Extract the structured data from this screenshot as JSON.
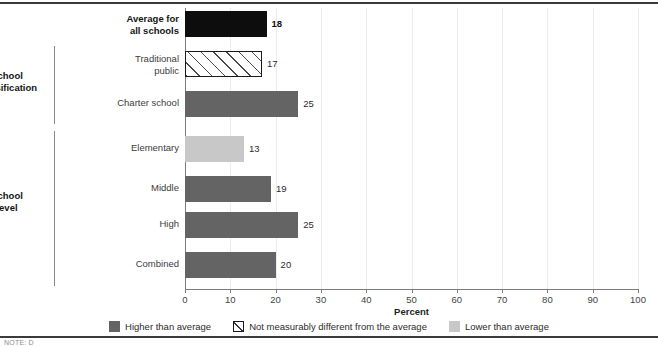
{
  "chart_data": {
    "type": "bar",
    "orientation": "horizontal",
    "title": "",
    "xlabel": "Percent",
    "ylabel": "",
    "xlim": [
      0,
      100
    ],
    "xticks": [
      0,
      10,
      20,
      30,
      40,
      50,
      60,
      70,
      80,
      90,
      100
    ],
    "grid": "vertical",
    "legend_position": "bottom-center",
    "categories": [
      "Average for all schools",
      "Traditional public",
      "Charter school",
      "Elementary",
      "Middle",
      "High",
      "Combined"
    ],
    "values": [
      18,
      17,
      25,
      13,
      19,
      25,
      20
    ],
    "point_styles": [
      "average",
      "not-measurably-different",
      "higher-than-average",
      "lower-than-average",
      "higher-than-average",
      "higher-than-average",
      "higher-than-average"
    ],
    "groups": [
      {
        "label": "School classification",
        "categories": [
          "Traditional public",
          "Charter school"
        ]
      },
      {
        "label": "School level",
        "categories": [
          "Elementary",
          "Middle",
          "High",
          "Combined"
        ]
      }
    ],
    "legend": [
      {
        "label": "Higher than average",
        "style": "higher-than-average"
      },
      {
        "label": "Not measurably different from the average",
        "style": "not-measurably-different"
      },
      {
        "label": "Lower than average",
        "style": "lower-than-average"
      }
    ],
    "colors": {
      "average": "#0d0d0d",
      "higher_than_average": "#646464",
      "lower_than_average": "#c8c8c8",
      "not_measurably_different": "#ffffff",
      "gridline": "#ececec",
      "axis": "#7c7c7c",
      "rule": "#3a3a3a"
    }
  },
  "bars": [
    {
      "label_line1": "Average for",
      "label_line2": "all schools",
      "value": "18",
      "style": "black",
      "bold": true,
      "top": 11,
      "label_top": 13
    },
    {
      "label_line1": "Traditional",
      "label_line2": "public",
      "value": "17",
      "style": "hatch",
      "bold": false,
      "top": 51,
      "label_top": 53
    },
    {
      "label_line1": "Charter school",
      "label_line2": "",
      "value": "25",
      "style": "dark",
      "bold": false,
      "top": 91,
      "label_top": 97
    },
    {
      "label_line1": "Elementary",
      "label_line2": "",
      "value": "13",
      "style": "light",
      "bold": false,
      "top": 136,
      "label_top": 142
    },
    {
      "label_line1": "Middle",
      "label_line2": "",
      "value": "19",
      "style": "dark",
      "bold": false,
      "top": 176,
      "label_top": 182
    },
    {
      "label_line1": "High",
      "label_line2": "",
      "value": "25",
      "style": "dark",
      "bold": false,
      "top": 212,
      "label_top": 218
    },
    {
      "label_line1": "Combined",
      "label_line2": "",
      "value": "20",
      "style": "dark",
      "bold": false,
      "top": 252,
      "label_top": 258
    }
  ],
  "groups": [
    {
      "label_line1": "School",
      "label_line2": "classification",
      "bracket_top": 46,
      "bracket_height": 78,
      "label_top": 70
    },
    {
      "label_line1": "School",
      "label_line2": "level",
      "bracket_top": 131,
      "bracket_height": 155,
      "label_top": 190
    }
  ],
  "axis": {
    "ticks": [
      {
        "label": "0",
        "value": 0
      },
      {
        "label": "10",
        "value": 10
      },
      {
        "label": "20",
        "value": 20
      },
      {
        "label": "30",
        "value": 30
      },
      {
        "label": "40",
        "value": 40
      },
      {
        "label": "50",
        "value": 50
      },
      {
        "label": "60",
        "value": 60
      },
      {
        "label": "70",
        "value": 70
      },
      {
        "label": "80",
        "value": 80
      },
      {
        "label": "90",
        "value": 90
      },
      {
        "label": "100",
        "value": 100
      }
    ],
    "title": "Percent"
  },
  "legend": {
    "items": [
      {
        "label": "Higher than average",
        "swatch": "dark"
      },
      {
        "label": "Not measurably different from the average",
        "swatch": "hatch"
      },
      {
        "label": "Lower than average",
        "swatch": "light"
      }
    ]
  },
  "footer": {
    "clipped_text": "NOTE: D"
  }
}
